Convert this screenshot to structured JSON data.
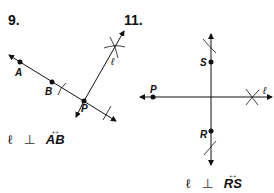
{
  "problems": [
    {
      "number": "9.",
      "points": {
        "A": "A",
        "B": "B",
        "P": "P"
      },
      "line_label": "ℓ",
      "caption": {
        "line": "ℓ",
        "symbol": "⊥",
        "ray_label": "AB",
        "arrow": "↔"
      }
    },
    {
      "number": "11.",
      "points": {
        "P": "P",
        "S": "S",
        "R": "R"
      },
      "line_label": "ℓ",
      "caption": {
        "line": "ℓ",
        "symbol": "⊥",
        "ray_label": "RS",
        "arrow": "↔"
      }
    }
  ]
}
